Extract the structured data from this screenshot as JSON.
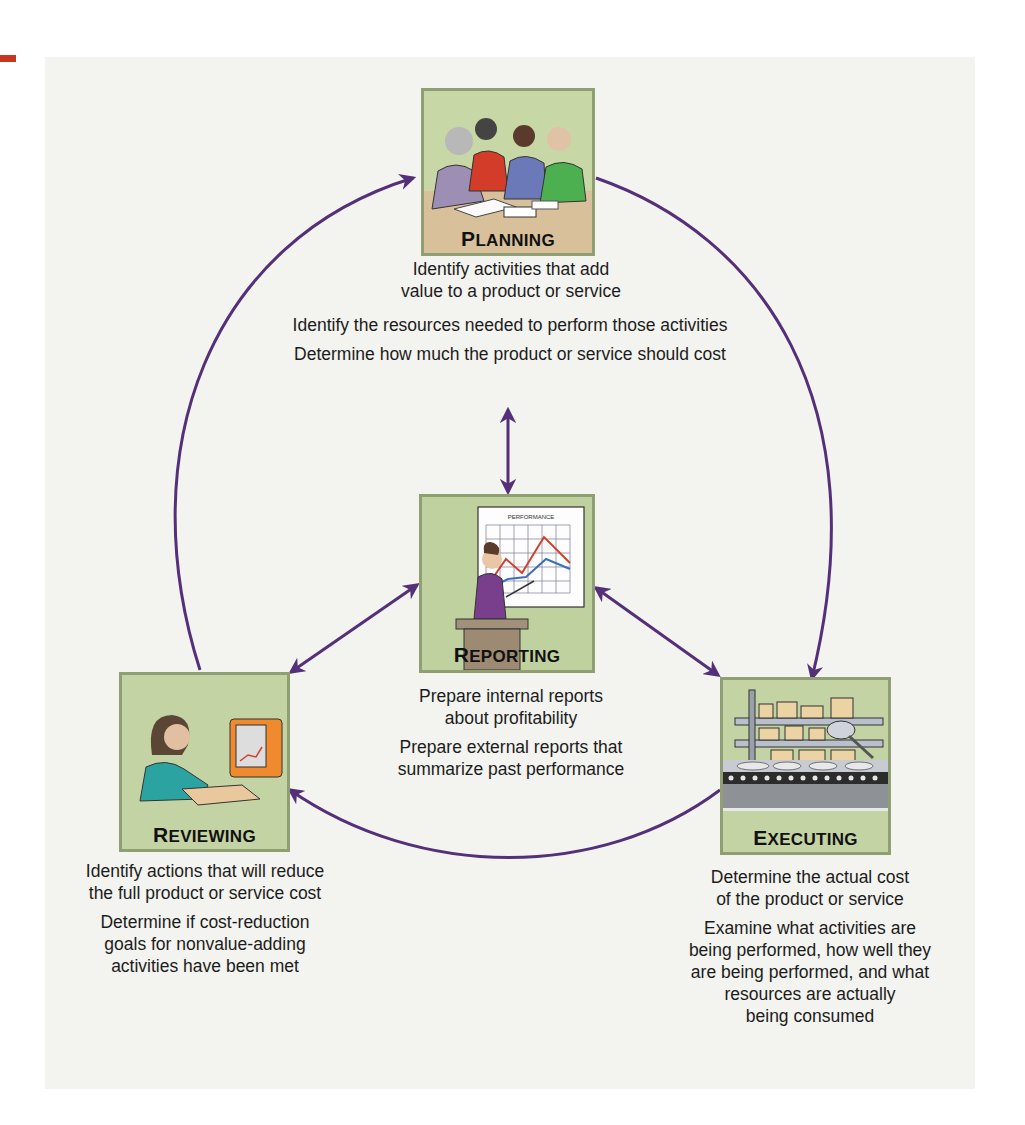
{
  "diagram": {
    "type": "cycle",
    "accent_color": "#55307a",
    "panel_color": "#f3f3ef",
    "stage_box_color": "#c3d3a3",
    "stages": [
      {
        "id": "planning",
        "label_first": "P",
        "label_rest": "LANNING",
        "label": "PLANNING",
        "illustration": "meeting-around-table",
        "descriptions": [
          "Identify activities that add value to a product or service",
          "Identify the resources needed to perform those activities",
          "Determine how much the product or service should cost"
        ],
        "lines": [
          "Identify activities that add",
          "value to a product or service",
          "Identify the resources needed to perform those activities",
          "Determine how much the product or service should cost"
        ]
      },
      {
        "id": "reporting",
        "label_first": "R",
        "label_rest": "EPORTING",
        "label": "REPORTING",
        "illustration": "presenter-with-performance-chart",
        "chart_title": "PERFORMANCE",
        "descriptions": [
          "Prepare internal reports about profitability",
          "Prepare external reports that summarize past performance"
        ],
        "lines": [
          "Prepare internal reports",
          "about profitability",
          "Prepare external reports that",
          "summarize past performance"
        ]
      },
      {
        "id": "reviewing",
        "label_first": "R",
        "label_rest": "EVIEWING",
        "label": "REVIEWING",
        "illustration": "person-at-computer",
        "descriptions": [
          "Identify actions that will reduce the full product or service cost",
          "Determine if cost-reduction goals for nonvalue-adding activities have been met"
        ],
        "lines": [
          "Identify actions that will reduce",
          "the full product or service cost",
          "Determine if cost-reduction",
          "goals for nonvalue-adding",
          "activities have been met"
        ]
      },
      {
        "id": "executing",
        "label_first": "E",
        "label_rest": "XECUTING",
        "label": "EXECUTING",
        "illustration": "conveyor-production-line",
        "descriptions": [
          "Determine the actual cost of the product or service",
          "Examine what activities are being performed, how well they are being performed, and what resources are actually being consumed"
        ],
        "lines": [
          "Determine the actual cost",
          "of the product or service",
          "Examine what activities are",
          "being performed, how well they",
          "are being performed, and what",
          "resources are actually",
          "being consumed"
        ]
      }
    ],
    "connections": [
      {
        "from": "planning",
        "to": "executing",
        "kind": "cycle-arc"
      },
      {
        "from": "executing",
        "to": "reviewing",
        "kind": "cycle-arc"
      },
      {
        "from": "reviewing",
        "to": "planning",
        "kind": "cycle-arc"
      },
      {
        "from": "reporting",
        "to": "planning",
        "kind": "bidirectional"
      },
      {
        "from": "reporting",
        "to": "reviewing",
        "kind": "bidirectional"
      },
      {
        "from": "reporting",
        "to": "executing",
        "kind": "bidirectional"
      }
    ]
  }
}
